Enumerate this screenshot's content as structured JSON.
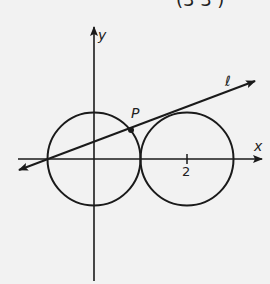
{
  "header_fragment": "(3   3  )",
  "diagram": {
    "axes": {
      "x_label": "x",
      "y_label": "y"
    },
    "tick_label": "2",
    "point_label": "P",
    "line_label": "ℓ",
    "circles": [
      {
        "center": [
          0,
          0
        ],
        "radius": 1
      },
      {
        "center": [
          2,
          0
        ],
        "radius": 1
      }
    ],
    "line": {
      "passes_through": [
        -1,
        0
      ],
      "tangent_to": "circle centered (2,0)"
    },
    "point_P": [
      0.778,
      0.629
    ],
    "stroke_color": "#1a1a1a",
    "background_color": "#f2f2f2"
  }
}
